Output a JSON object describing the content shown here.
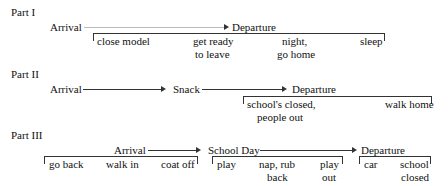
{
  "parts": [
    {
      "title": "Part I",
      "stages": [
        "Arrival",
        "Departure"
      ],
      "steps": [
        {
          "line1": "close model",
          "line2": ""
        },
        {
          "line1": "get ready",
          "line2": "to leave"
        },
        {
          "line1": "night,",
          "line2": "go home"
        },
        {
          "line1": "sleep",
          "line2": ""
        }
      ]
    },
    {
      "title": "Part II",
      "stages": [
        "Arrival",
        "Snack",
        "Departure"
      ],
      "steps": [
        {
          "line1": "school's closed,",
          "line2": "people out"
        },
        {
          "line1": "walk home",
          "line2": ""
        }
      ]
    },
    {
      "title": "Part III",
      "stages": [
        "Arrival",
        "School Day",
        "Departure"
      ],
      "groups": [
        {
          "steps": [
            {
              "line1": "go back",
              "line2": ""
            },
            {
              "line1": "walk in",
              "line2": ""
            },
            {
              "line1": "coat off",
              "line2": ""
            }
          ]
        },
        {
          "steps": [
            {
              "line1": "play",
              "line2": ""
            },
            {
              "line1": "nap, rub",
              "line2": "back"
            },
            {
              "line1": "play",
              "line2": "out"
            }
          ]
        },
        {
          "steps": [
            {
              "line1": "car",
              "line2": ""
            },
            {
              "line1": "school",
              "line2": "closed"
            }
          ]
        }
      ]
    }
  ]
}
